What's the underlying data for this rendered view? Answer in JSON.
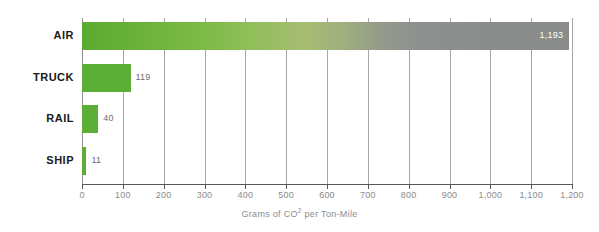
{
  "chart_data": {
    "type": "bar",
    "orientation": "horizontal",
    "title": "",
    "subtitle": "",
    "xlabel_prefix": "Grams of CO",
    "xlabel_sup": "2",
    "xlabel_suffix": " per Ton-Mile",
    "xlabel": "Grams of CO2 per Ton-Mile",
    "ylabel": "",
    "categories": [
      "AIR",
      "TRUCK",
      "RAIL",
      "SHIP"
    ],
    "values": [
      1193,
      119,
      40,
      11
    ],
    "value_labels": [
      "1,193",
      "119",
      "40",
      "11"
    ],
    "xlim": [
      0,
      1200
    ],
    "xticks": [
      0,
      100,
      200,
      300,
      400,
      500,
      600,
      700,
      800,
      900,
      1000,
      1100,
      1200
    ],
    "xtick_labels": [
      "0",
      "100",
      "200",
      "300",
      "400",
      "500",
      "600",
      "700",
      "800",
      "900",
      "1,000",
      "1,100",
      "1,200"
    ],
    "grid": "vertical",
    "legend": "none",
    "colors": {
      "bar_green": "#5cad36",
      "bar_gradient_start": "#5aab2e",
      "bar_gradient_end": "#8a8b8b",
      "gridline": "#a6a6a6",
      "axis_line": "#58595b",
      "tick_label": "#8a8c8e",
      "category_label": "#1a1a1a",
      "value_label_outside": "#6d6e70",
      "value_label_inside": "#ffffff",
      "background": "#ffffff"
    },
    "value_label_placement": [
      "inside-right",
      "outside-right",
      "outside-right",
      "outside-right"
    ]
  }
}
